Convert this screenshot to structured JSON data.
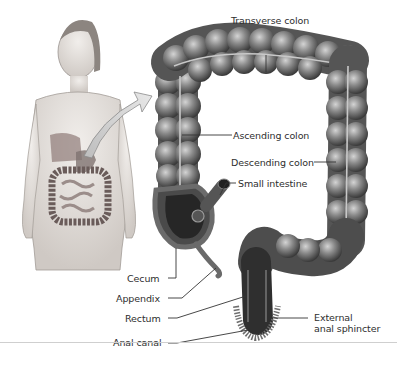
{
  "figure": {
    "labels": {
      "transverse_colon": "Transverse colon",
      "ascending_colon": "Ascending colon",
      "descending_colon": "Descending colon",
      "small_intestine": "Small intestine",
      "cecum": "Cecum",
      "appendix": "Appendix",
      "rectum": "Rectum",
      "anal_canal": "Anal canal",
      "external_anal_sphincter_line1": "External",
      "external_anal_sphincter_line2": "anal sphincter"
    },
    "colors": {
      "colon_dark": "#3a3a3a",
      "colon_mid": "#7a7a7a",
      "colon_light": "#c8c8c8",
      "skin": "#e6e2df",
      "leader_line": "#333333"
    }
  }
}
